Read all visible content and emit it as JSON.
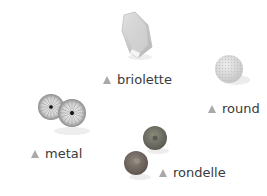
{
  "items": [
    {
      "id": "briolette",
      "label": "briolette"
    },
    {
      "id": "round",
      "label": "round"
    },
    {
      "id": "metal",
      "label": "metal"
    },
    {
      "id": "rondelle",
      "label": "rondelle"
    }
  ],
  "colors": {
    "triangle": "#a9a9a9",
    "text": "#3a3a3a"
  }
}
